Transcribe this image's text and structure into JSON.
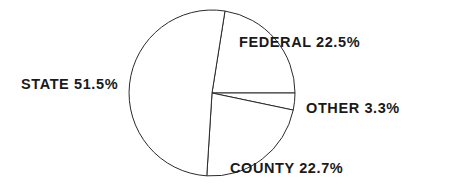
{
  "chart_data": {
    "type": "pie",
    "title": "",
    "slices": [
      {
        "label": "FEDERAL",
        "value": 22.5,
        "display": "FEDERAL  22.5%"
      },
      {
        "label": "OTHER",
        "value": 3.3,
        "display": "OTHER  3.3%"
      },
      {
        "label": "COUNTY",
        "value": 22.7,
        "display": "COUNTY  22.7%"
      },
      {
        "label": "STATE",
        "value": 51.5,
        "display": "STATE  51.5%"
      }
    ],
    "units": "%",
    "fill": "#ffffff",
    "stroke": "#2a2a2a"
  }
}
